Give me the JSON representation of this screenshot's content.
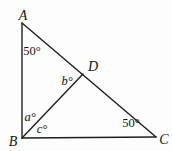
{
  "diagram": {
    "type": "triangle-geometry-figure",
    "background_color": "#fdfdfd",
    "line_color": "#1e1e1e",
    "vertices": {
      "A": "A",
      "B": "B",
      "C": "C",
      "D": "D"
    },
    "angles": {
      "at_A": "50°",
      "at_D": "b°",
      "at_B_upper": "a°",
      "at_B_lower": "c°",
      "at_C": "50°"
    }
  }
}
